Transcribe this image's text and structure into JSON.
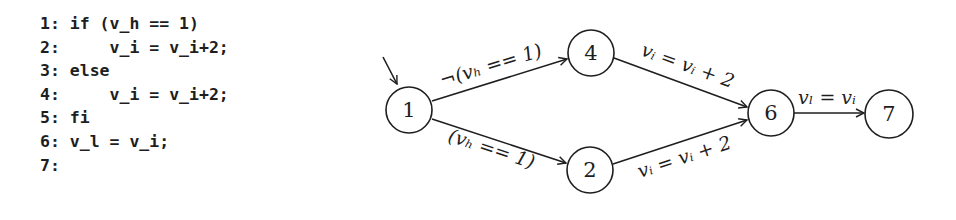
{
  "code": {
    "lines": [
      "1: if (v_h == 1)",
      "2:     v_i = v_i+2;",
      "3: else",
      "4:     v_i = v_i+2;",
      "5: fi",
      "6: v_l = v_i;",
      "7:"
    ]
  },
  "graph": {
    "nodes": [
      {
        "id": "1",
        "label": "1",
        "cx": 409,
        "cy": 110
      },
      {
        "id": "4",
        "label": "4",
        "cx": 591,
        "cy": 53
      },
      {
        "id": "2",
        "label": "2",
        "cx": 590,
        "cy": 170
      },
      {
        "id": "6",
        "label": "6",
        "cx": 771,
        "cy": 113
      },
      {
        "id": "7",
        "label": "7",
        "cx": 889,
        "cy": 114
      }
    ],
    "edges": [
      {
        "from": "1",
        "to": "4",
        "label": "¬(vₕ == 1)"
      },
      {
        "from": "1",
        "to": "2",
        "label": "(vₕ == 1)"
      },
      {
        "from": "4",
        "to": "6",
        "label": "vᵢ = vᵢ + 2"
      },
      {
        "from": "2",
        "to": "6",
        "label": "vᵢ = vᵢ + 2"
      },
      {
        "from": "6",
        "to": "7",
        "label": "vₗ = vᵢ"
      }
    ],
    "start_node": "1"
  }
}
